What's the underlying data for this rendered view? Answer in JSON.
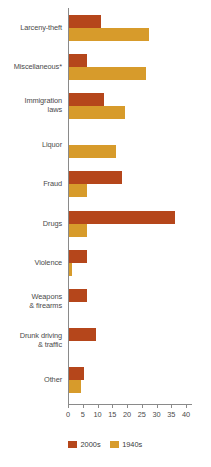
{
  "chart_data": {
    "type": "bar",
    "orientation": "horizontal",
    "title": "",
    "xlabel": "",
    "ylabel": "",
    "xlim": [
      0,
      42
    ],
    "xticks": [
      0,
      5,
      10,
      15,
      20,
      25,
      30,
      35,
      40
    ],
    "xtick_labels": [
      "0",
      "5",
      "10",
      "15",
      "20",
      "25",
      "30",
      "35",
      "40"
    ],
    "grid": false,
    "legend_position": "bottom-left",
    "categories": [
      "Larceny-theft",
      "Miscellaneous*",
      "Immigration laws",
      "Liquor",
      "Fraud",
      "Drugs",
      "Violence",
      "Weapons & firearms",
      "Drunk driving & traffic",
      "Other"
    ],
    "series": [
      {
        "name": "2000s",
        "color": "#b5461b",
        "values": [
          11,
          6,
          12,
          0,
          18,
          36,
          6,
          6,
          9,
          5
        ]
      },
      {
        "name": "1940s",
        "color": "#d79b2b",
        "values": [
          27,
          26,
          19,
          16,
          6,
          6,
          1,
          0,
          0,
          4
        ]
      }
    ]
  },
  "axis": {
    "tick_labels": [
      "0",
      "5",
      "10",
      "15",
      "20",
      "25",
      "30",
      "35",
      "40"
    ]
  },
  "categories": [
    {
      "label": "Larceny-theft",
      "lines": [
        "Larceny-theft"
      ]
    },
    {
      "label": "Miscellaneous*",
      "lines": [
        "Miscellaneous*"
      ]
    },
    {
      "label": "Immigration laws",
      "lines": [
        "Immigration",
        "laws"
      ]
    },
    {
      "label": "Liquor",
      "lines": [
        "Liquor"
      ]
    },
    {
      "label": "Fraud",
      "lines": [
        "Fraud"
      ]
    },
    {
      "label": "Drugs",
      "lines": [
        "Drugs"
      ]
    },
    {
      "label": "Violence",
      "lines": [
        "Violence"
      ]
    },
    {
      "label": "Weapons & firearms",
      "lines": [
        "Weapons",
        "& firearms"
      ]
    },
    {
      "label": "Drunk driving & traffic",
      "lines": [
        "Drunk driving",
        "& traffic"
      ]
    },
    {
      "label": "Other",
      "lines": [
        "Other"
      ]
    }
  ],
  "legend": {
    "items": [
      {
        "label": "2000s",
        "color": "#b5461b"
      },
      {
        "label": "1940s",
        "color": "#d79b2b"
      }
    ]
  }
}
